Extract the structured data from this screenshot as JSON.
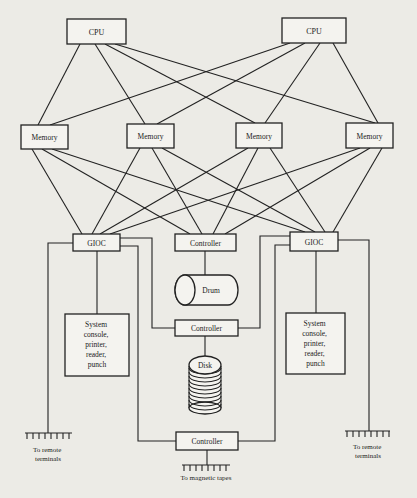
{
  "diagram": {
    "type": "computer-system-architecture",
    "nodes": {
      "cpu1": {
        "label": "CPU"
      },
      "cpu2": {
        "label": "CPU"
      },
      "mem1": {
        "label": "Memory"
      },
      "mem2": {
        "label": "Memory"
      },
      "mem3": {
        "label": "Memory"
      },
      "mem4": {
        "label": "Memory"
      },
      "gioc1": {
        "label": "GIOC"
      },
      "gioc2": {
        "label": "GIOC"
      },
      "ctrl_drum": {
        "label": "Controller"
      },
      "drum": {
        "label": "Drum"
      },
      "ctrl_disk": {
        "label": "Controller"
      },
      "disk": {
        "label": "Disk"
      },
      "ctrl_tape": {
        "label": "Controller"
      },
      "console1": {
        "lines": [
          "System",
          "console,",
          "printer,",
          "reader,",
          "punch"
        ]
      },
      "console2": {
        "lines": [
          "System",
          "console,",
          "printer,",
          "reader,",
          "punch"
        ]
      }
    },
    "terminals": {
      "left": {
        "lines": [
          "To remote",
          "terminals"
        ]
      },
      "right": {
        "lines": [
          "To remote",
          "terminals"
        ]
      },
      "tapes": {
        "lines": [
          "To magnetic tapes"
        ]
      }
    },
    "edges": [
      [
        "cpu1",
        "mem1"
      ],
      [
        "cpu1",
        "mem2"
      ],
      [
        "cpu1",
        "mem3"
      ],
      [
        "cpu1",
        "mem4"
      ],
      [
        "cpu2",
        "mem1"
      ],
      [
        "cpu2",
        "mem2"
      ],
      [
        "cpu2",
        "mem3"
      ],
      [
        "cpu2",
        "mem4"
      ],
      [
        "mem1",
        "gioc1"
      ],
      [
        "mem1",
        "ctrl_drum"
      ],
      [
        "mem1",
        "gioc2"
      ],
      [
        "mem2",
        "gioc1"
      ],
      [
        "mem2",
        "ctrl_drum"
      ],
      [
        "mem2",
        "gioc2"
      ],
      [
        "mem3",
        "gioc1"
      ],
      [
        "mem3",
        "ctrl_drum"
      ],
      [
        "mem3",
        "gioc2"
      ],
      [
        "mem4",
        "gioc1"
      ],
      [
        "mem4",
        "ctrl_drum"
      ],
      [
        "mem4",
        "gioc2"
      ],
      [
        "ctrl_drum",
        "drum"
      ],
      [
        "gioc1",
        "ctrl_disk"
      ],
      [
        "gioc2",
        "ctrl_disk"
      ],
      [
        "ctrl_disk",
        "disk"
      ],
      [
        "gioc1",
        "ctrl_tape"
      ],
      [
        "gioc2",
        "ctrl_tape"
      ],
      [
        "gioc1",
        "console1"
      ],
      [
        "gioc2",
        "console2"
      ],
      [
        "gioc1",
        "terminals_left"
      ],
      [
        "gioc2",
        "terminals_right"
      ],
      [
        "ctrl_tape",
        "tapes"
      ]
    ]
  }
}
